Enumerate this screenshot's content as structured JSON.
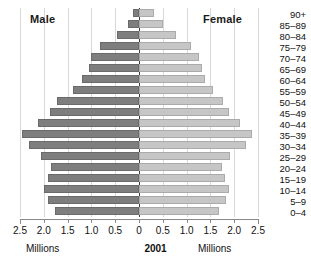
{
  "labels": {
    "male": "Male",
    "female": "Female",
    "year": "2001",
    "units_left": "Millions",
    "units_right": "Millions"
  },
  "axis": {
    "tick_labels": [
      "2.5",
      "2.0",
      "1.5",
      "1.0",
      "0.5",
      "0",
      "0.5",
      "1.0",
      "1.5",
      "2.0",
      "2.5"
    ],
    "tick_values": [
      -2.5,
      -2.0,
      -1.5,
      -1.0,
      -0.5,
      0,
      0.5,
      1.0,
      1.5,
      2.0,
      2.5
    ],
    "min": -2.5,
    "max": 2.5
  },
  "colors": {
    "male_fill": "#7e7e7e",
    "male_stroke": "#6a6a6a",
    "female_fill": "#c6c6c6",
    "female_stroke": "#ababab",
    "zero_axis": "#3a3a3a",
    "gridline": "#d8d8d8"
  },
  "chart_data": {
    "type": "bar",
    "title": "",
    "subtitle": "",
    "xlabel": "Millions",
    "ylabel": "",
    "xlim": [
      -2.5,
      2.5
    ],
    "grid": true,
    "legend_position": "inline-top",
    "orientation": "horizontal",
    "layout": "population-pyramid",
    "annotations": [
      "Male",
      "Female",
      "2001",
      "Millions",
      "Millions"
    ],
    "categories": [
      "90+",
      "85-89",
      "80-84",
      "75-79",
      "70-74",
      "65-69",
      "60-64",
      "55-59",
      "50-54",
      "45-49",
      "40-44",
      "35-39",
      "30-34",
      "25-29",
      "20-24",
      "15-19",
      "10-14",
      "5-9",
      "0-4"
    ],
    "series": [
      {
        "name": "Male",
        "values": [
          0.13,
          0.24,
          0.46,
          0.82,
          1.0,
          1.05,
          1.2,
          1.38,
          1.72,
          1.88,
          2.12,
          2.45,
          2.32,
          2.05,
          1.85,
          1.92,
          2.0,
          1.92,
          1.76
        ]
      },
      {
        "name": "Female",
        "values": [
          0.31,
          0.5,
          0.77,
          1.1,
          1.25,
          1.32,
          1.38,
          1.55,
          1.76,
          1.9,
          2.12,
          2.38,
          2.25,
          1.92,
          1.75,
          1.8,
          1.9,
          1.82,
          1.68
        ]
      }
    ]
  }
}
